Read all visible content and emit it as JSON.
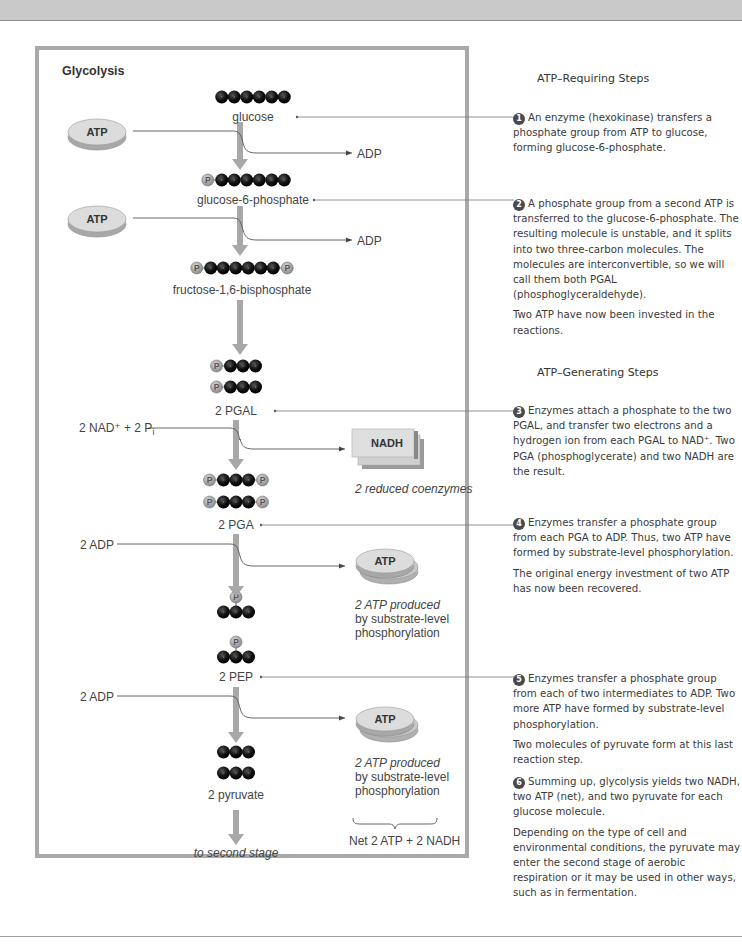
{
  "figure": {
    "title": "Glycolysis",
    "molecules": {
      "glucose": "glucose",
      "g6p": "glucose-6-phosphate",
      "f16bp": "fructose-1,6-bisphosphate",
      "pgal": "2 PGAL",
      "pga": "2 PGA",
      "pep": "2 PEP",
      "pyruvate": "2 pyruvate",
      "next": "to second stage"
    },
    "inputs": {
      "atp1": "ATP",
      "atp2": "ATP",
      "nad": "2 NAD⁺ + 2 P",
      "nad_sub": "i",
      "adp1": "2 ADP",
      "adp2": "2 ADP"
    },
    "outputs": {
      "adp1": "ADP",
      "adp2": "ADP",
      "nadh": "NADH",
      "nadh_caption": "2 reduced coenzymes",
      "atp_disc1": "ATP",
      "atp_caption1_italic": "2 ATP produced",
      "atp_caption1_rest_1": "by substrate-level",
      "atp_caption1_rest_2": "phosphorylation",
      "atp_disc2": "ATP",
      "atp_caption2_italic": "2 ATP produced",
      "atp_caption2_rest_1": "by substrate-level",
      "atp_caption2_rest_2": "phosphorylation",
      "net": "Net 2 ATP + 2 NADH"
    },
    "phosphate_symbol": "P",
    "colors": {
      "arrow": "#a8a8a8",
      "carbon": "#111111",
      "phosphate": "#9a9a9a",
      "panel_border": "#a9a9a9",
      "line": "#555555"
    }
  },
  "sidebar": {
    "section_requiring": "ATP–Requiring Steps",
    "section_generating": "ATP–Generating Steps",
    "steps": [
      {
        "num": "1",
        "text": "An enzyme (hexokinase) transfers a phosphate group from ATP to glucose, forming glucose-6-phosphate."
      },
      {
        "num": "2",
        "text": "A phosphate group from a second ATP is transferred to the glucose-6-phosphate. The resulting molecule is unstable, and it splits into two three-carbon molecules. The molecules are interconvertible, so we will call them both PGAL (phosphoglyceraldehyde).",
        "note": "Two ATP have now been invested in the reactions."
      },
      {
        "num": "3",
        "text": "Enzymes attach a phosphate to the two PGAL, and transfer two electrons and a hydrogen ion from each PGAL to NAD⁺. Two PGA (phosphoglycerate) and two NADH are the result."
      },
      {
        "num": "4",
        "text": "Enzymes transfer a phosphate group from each PGA to ADP. Thus, two ATP have formed by substrate-level phosphorylation.",
        "note": "The original energy investment of two ATP has now been recovered."
      },
      {
        "num": "5",
        "text": "Enzymes transfer a phosphate group from each of two intermediates to ADP. Two more ATP have formed by substrate-level phosphorylation.",
        "note": "Two molecules of pyruvate form at this last reaction step."
      },
      {
        "num": "6",
        "text": "Summing up, glycolysis yields two NADH, two ATP (net), and two pyruvate for each glucose molecule.",
        "note": "Depending on the type of cell and environmental conditions, the pyruvate may enter the second stage of aerobic respiration or it may be used in other ways, such as in fermentation."
      }
    ]
  }
}
